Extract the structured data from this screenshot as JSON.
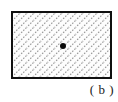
{
  "figure": {
    "label": "( b )",
    "shape": {
      "kind": "rectangle",
      "fill_style": "diagonal-hatch",
      "hatch_direction": "lower-left-to-upper-right",
      "hatch_angle_deg": 45,
      "hatch_spacing_px": 7,
      "hatch_color": "#9a9a9a",
      "border_color": "#101010",
      "border_width_px": 2,
      "interior_color": "#fdfdfd",
      "x_px": 11,
      "y_px": 11,
      "width_px": 101,
      "height_px": 68
    },
    "point": {
      "name": "center-point",
      "marker": "filled-circle",
      "color": "#0a0a0a",
      "diameter_px": 6,
      "x_px": 63,
      "y_px": 46
    },
    "background_color": "#ffffff"
  }
}
